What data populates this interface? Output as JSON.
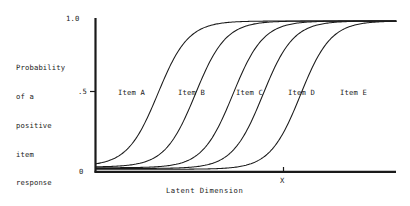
{
  "figure": {
    "background_color": "#ffffff",
    "ink_color": "#1a1a1a"
  },
  "axes": {
    "y": {
      "title_lines": [
        "Probability",
        "of a",
        "positive",
        "item",
        "response"
      ],
      "ticks": [
        {
          "label": "1.0",
          "value": 1.0
        },
        {
          "label": ".5",
          "value": 0.5
        },
        {
          "label": "0",
          "value": 0.0
        }
      ]
    },
    "x": {
      "title": "Latent Dimension",
      "ticks": [
        {
          "label": "X",
          "value": 0.0
        }
      ]
    }
  },
  "curve_labels": [
    {
      "text": "Item A",
      "x": 118,
      "y": 88
    },
    {
      "text": "Item B",
      "x": 178,
      "y": 88
    },
    {
      "text": "Item C",
      "x": 236,
      "y": 88
    },
    {
      "text": "Item D",
      "x": 288,
      "y": 88
    },
    {
      "text": "Item E",
      "x": 340,
      "y": 88
    }
  ],
  "chart_data": {
    "type": "line",
    "title": "",
    "xlabel": "Latent Dimension",
    "ylabel": "Probability of a positive item response",
    "xlim": [
      -4.0,
      4.0
    ],
    "ylim": [
      0.0,
      1.0
    ],
    "grid": false,
    "legend": "inline-curve-labels",
    "model": "2-parameter logistic item characteristic curves",
    "x_tick_values": [
      0.0
    ],
    "x_tick_labels": [
      "X"
    ],
    "y_tick_values": [
      0.0,
      0.5,
      1.0
    ],
    "y_tick_labels": [
      "0",
      ".5",
      "1.0"
    ],
    "series": [
      {
        "name": "Item A",
        "difficulty_b": -2.35,
        "discrimination_a": 1.45,
        "guessing_c": 0.035,
        "x": [
          -4.0,
          -3.5,
          -3.0,
          -2.5,
          -2.0,
          -1.5,
          -1.0,
          -0.5,
          0.0,
          0.5,
          1.0,
          1.5,
          2.0,
          2.5,
          3.0,
          3.5,
          4.0
        ],
        "y": [
          0.072,
          0.105,
          0.164,
          0.268,
          0.415,
          0.578,
          0.724,
          0.829,
          0.897,
          0.939,
          0.964,
          0.979,
          0.987,
          0.992,
          0.995,
          0.997,
          0.998
        ]
      },
      {
        "name": "Item B",
        "difficulty_b": -1.35,
        "discrimination_a": 1.45,
        "guessing_c": 0.03,
        "x": [
          -4.0,
          -3.5,
          -3.0,
          -2.5,
          -2.0,
          -1.5,
          -1.0,
          -0.5,
          0.0,
          0.5,
          1.0,
          1.5,
          2.0,
          2.5,
          3.0,
          3.5,
          4.0
        ],
        "y": [
          0.04,
          0.051,
          0.073,
          0.111,
          0.176,
          0.281,
          0.424,
          0.584,
          0.723,
          0.824,
          0.89,
          0.932,
          0.957,
          0.973,
          0.983,
          0.989,
          0.993
        ]
      },
      {
        "name": "Item C",
        "difficulty_b": -0.35,
        "discrimination_a": 1.45,
        "guessing_c": 0.025,
        "x": [
          -4.0,
          -3.5,
          -3.0,
          -2.5,
          -2.0,
          -1.5,
          -1.0,
          -0.5,
          0.0,
          0.5,
          1.0,
          1.5,
          2.0,
          2.5,
          3.0,
          3.5,
          4.0
        ],
        "y": [
          0.03,
          0.033,
          0.04,
          0.054,
          0.079,
          0.123,
          0.195,
          0.3,
          0.434,
          0.577,
          0.704,
          0.802,
          0.87,
          0.915,
          0.945,
          0.964,
          0.976
        ]
      },
      {
        "name": "Item D",
        "difficulty_b": 0.45,
        "discrimination_a": 1.45,
        "guessing_c": 0.02,
        "x": [
          -4.0,
          -3.5,
          -3.0,
          -2.5,
          -2.0,
          -1.5,
          -1.0,
          -0.5,
          0.0,
          0.5,
          1.0,
          1.5,
          2.0,
          2.5,
          3.0,
          3.5,
          4.0
        ],
        "y": [
          0.022,
          0.024,
          0.027,
          0.033,
          0.045,
          0.066,
          0.103,
          0.166,
          0.263,
          0.394,
          0.541,
          0.678,
          0.785,
          0.86,
          0.909,
          0.94,
          0.961
        ]
      },
      {
        "name": "Item E",
        "difficulty_b": 1.45,
        "discrimination_a": 1.45,
        "guessing_c": 0.015,
        "x": [
          -4.0,
          -3.5,
          -3.0,
          -2.5,
          -2.0,
          -1.5,
          -1.0,
          -0.5,
          0.0,
          0.5,
          1.0,
          1.5,
          2.0,
          2.5,
          3.0,
          3.5,
          4.0
        ],
        "y": [
          0.016,
          0.017,
          0.018,
          0.021,
          0.026,
          0.035,
          0.05,
          0.075,
          0.119,
          0.191,
          0.298,
          0.437,
          0.584,
          0.712,
          0.809,
          0.875,
          0.918
        ]
      }
    ]
  }
}
